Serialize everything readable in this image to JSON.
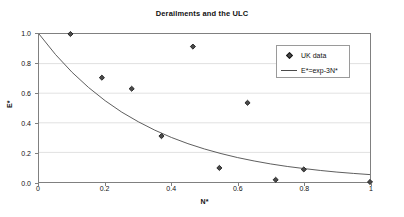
{
  "chart_data": {
    "type": "scatter",
    "title": "Derailments and the ULC",
    "xlabel": "N*",
    "ylabel": "E*",
    "xlim": [
      0,
      1
    ],
    "ylim": [
      0,
      1
    ],
    "grid": true,
    "legend_position": "upper-right",
    "xticks": [
      "0",
      "0.2",
      "0.4",
      "0.6",
      "0.8",
      "1"
    ],
    "xtick_values": [
      0,
      0.2,
      0.4,
      0.6,
      0.8,
      1
    ],
    "yticks": [
      "0.0",
      "0.2",
      "0.4",
      "0.6",
      "0.8",
      "1.0"
    ],
    "ytick_values": [
      0,
      0.2,
      0.4,
      0.6,
      0.8,
      1
    ],
    "series": [
      {
        "name": "UK data",
        "type": "scatter",
        "marker": "diamond",
        "color": "#4a4a4a",
        "points": [
          {
            "x": 0.095,
            "y": 1.0
          },
          {
            "x": 0.19,
            "y": 0.705
          },
          {
            "x": 0.28,
            "y": 0.63
          },
          {
            "x": 0.37,
            "y": 0.31
          },
          {
            "x": 0.465,
            "y": 0.915
          },
          {
            "x": 0.545,
            "y": 0.095
          },
          {
            "x": 0.63,
            "y": 0.535
          },
          {
            "x": 0.715,
            "y": 0.015
          },
          {
            "x": 0.8,
            "y": 0.085
          },
          {
            "x": 1.0,
            "y": 0.0
          }
        ]
      },
      {
        "name": "E*=exp-3N*",
        "type": "line",
        "color": "#4a4a4a",
        "formula": "E* = exp(-3 N*)",
        "x": [
          0,
          0.05,
          0.1,
          0.15,
          0.2,
          0.25,
          0.3,
          0.35,
          0.4,
          0.45,
          0.5,
          0.55,
          0.6,
          0.65,
          0.7,
          0.75,
          0.8,
          0.85,
          0.9,
          0.95,
          1.0
        ],
        "values": [
          1.0,
          0.861,
          0.741,
          0.638,
          0.549,
          0.472,
          0.407,
          0.35,
          0.301,
          0.259,
          0.223,
          0.192,
          0.165,
          0.142,
          0.122,
          0.105,
          0.091,
          0.078,
          0.067,
          0.058,
          0.05
        ]
      }
    ]
  },
  "legend": {
    "items": [
      {
        "label": "UK data",
        "key": "diamond-marker"
      },
      {
        "label": "E*=exp-3N*",
        "key": "line-sample"
      }
    ]
  }
}
